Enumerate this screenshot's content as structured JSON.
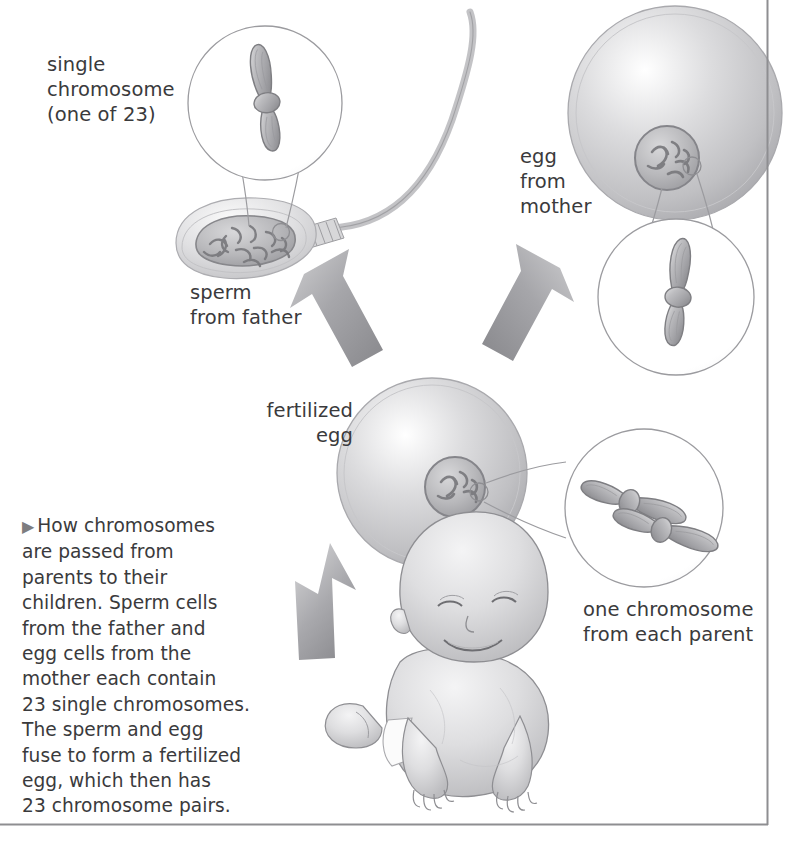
{
  "figure": {
    "title_text": "How chromosomes are passed from parents to their children",
    "labels": {
      "single_chromosome": "single\nchromosome\n(one of 23)",
      "egg_from_mother": "egg\nfrom\nmother",
      "sperm_from_father": "sperm\nfrom father",
      "fertilized_egg": "fertilized\negg",
      "one_chromosome_each_parent": "one chromosome\nfrom each parent"
    },
    "caption": {
      "marker": "▶",
      "lines": [
        "How chromosomes",
        "are passed from",
        "parents to their",
        "children. Sperm cells",
        "from the father and",
        "egg cells from the",
        "mother each contain",
        "23 single chromosomes.",
        "The sperm and egg",
        "fuse to form a fertilized",
        "egg, which then has",
        "23 chromosome pairs."
      ],
      "full_text": "How chromosomes are passed from parents to their children. Sperm cells from the father and egg cells from the mother each contain 23 single chromosomes. The sperm and egg fuse to form a fertilized egg, which then has 23 chromosome pairs."
    },
    "illustrations": {
      "sperm_cell": "sperm-cell-illustration",
      "egg_cell": "egg-cell-illustration",
      "fertilized_egg_cell": "fertilized-egg-illustration",
      "baby": "baby-illustration",
      "single_chromosome_magnifier": "single-chromosome-magnifier",
      "egg_chromosome_magnifier": "egg-chromosome-magnifier",
      "chromosome_pair_magnifier": "chromosome-pair-magnifier",
      "arrow_sperm_to_egg": "arrow-sperm-to-fertilized-egg",
      "arrow_egg_to_egg": "arrow-egg-to-fertilized-egg",
      "arrow_egg_to_baby": "arrow-fertilized-egg-to-baby"
    },
    "colors": {
      "text": "#3a3a3c",
      "line": "#8a8a8d",
      "cell_fill": "#c9c9cb",
      "chromosome_fill": "#b4b4b7",
      "arrow_fill": "#9a9a9d",
      "page_rule": "#8e8e91",
      "background": "#ffffff"
    },
    "numbers": {
      "single_chromosome_count": 23,
      "chromosome_pair_count": 23
    }
  }
}
